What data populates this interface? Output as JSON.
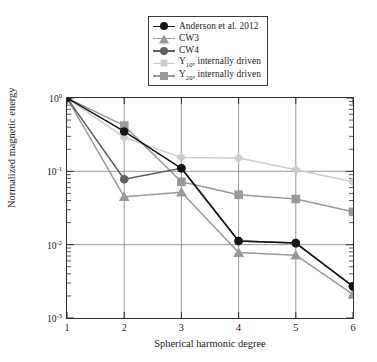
{
  "chart_data": {
    "type": "line",
    "title": "",
    "xlabel": "Spherical harmonic degree",
    "ylabel": "Normalized magnetic energy",
    "x": [
      1,
      2,
      3,
      4,
      5,
      6
    ],
    "xlim": [
      1,
      6
    ],
    "ylim": [
      0.001,
      1
    ],
    "yscale": "log",
    "xtick_labels": [
      "1",
      "2",
      "3",
      "4",
      "5",
      "6"
    ],
    "ytick_labels": [
      "10",
      "10",
      "10",
      "10"
    ],
    "ytick_exponents": [
      "0",
      "-1",
      "-2",
      "-3"
    ],
    "ytick_values": [
      1,
      0.1,
      0.01,
      0.001
    ],
    "grid": true,
    "legend_position": "top-center",
    "series": [
      {
        "name": "Anderson et al. 2012",
        "marker": "circle",
        "color": "#141414",
        "values": [
          1.0,
          0.35,
          0.11,
          0.0112,
          0.0105,
          0.0027
        ]
      },
      {
        "name": "CW3",
        "marker": "triangle",
        "color": "#9a9a9a",
        "values": [
          1.0,
          0.045,
          0.052,
          0.0078,
          0.0072,
          0.0021
        ]
      },
      {
        "name": "CW4",
        "marker": "circle",
        "color": "#606060",
        "values": [
          1.0,
          0.078,
          0.11,
          0.0112,
          0.0105,
          0.0027
        ]
      },
      {
        "name": "Y10, internally driven",
        "marker": "diamond",
        "color": "#cdcdcd",
        "values": [
          1.0,
          0.29,
          0.155,
          0.152,
          0.105,
          0.072
        ]
      },
      {
        "name": "Y20, internally driven",
        "marker": "square",
        "color": "#9a9a9a",
        "values": [
          1.0,
          0.42,
          0.072,
          0.048,
          0.042,
          0.028
        ]
      }
    ]
  },
  "legend": {
    "entries": [
      {
        "label": "Anderson et al. 2012",
        "sub": "",
        "tail": ""
      },
      {
        "label": "CW3",
        "sub": "",
        "tail": ""
      },
      {
        "label": "CW4",
        "sub": "",
        "tail": ""
      },
      {
        "label": "Y",
        "sub": "10",
        "tail": ", internally driven"
      },
      {
        "label": "Y",
        "sub": "20",
        "tail": ", internally driven"
      }
    ]
  },
  "colors": {
    "axis": "#2e2e2e",
    "grid": "#8c8c8c",
    "background": "#ffffff"
  }
}
